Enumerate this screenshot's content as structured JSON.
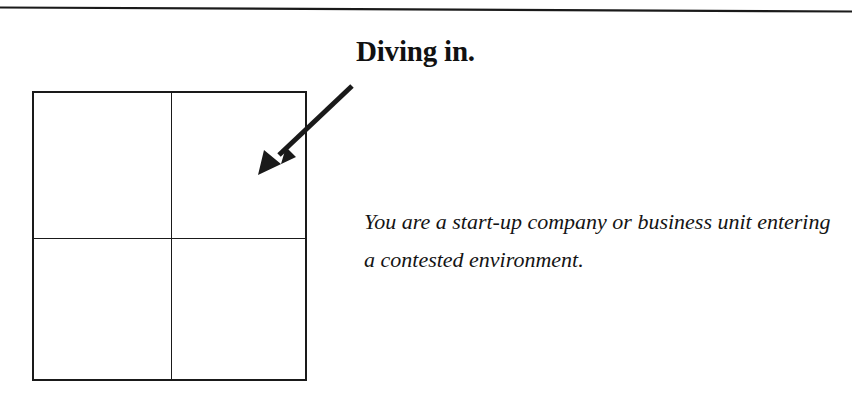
{
  "page": {
    "background_color": "#ffffff",
    "ink_color": "#1a1a1a",
    "width": 852,
    "height": 401
  },
  "divider": {
    "name": "top-horizontal-rule",
    "color": "#1a1a1a"
  },
  "headline": {
    "text": "Diving in."
  },
  "body": {
    "text": "You are a start-up company or business unit entering a contested environment."
  },
  "arrow": {
    "name": "pointer-arrow",
    "color": "#1a1a1a",
    "from_x": 352,
    "from_y": 86,
    "to_x": 259,
    "to_y": 174
  },
  "matrix": {
    "name": "two-by-two-matrix",
    "rows": 2,
    "columns": 2,
    "cells": [
      {
        "label": ""
      },
      {
        "label": ""
      },
      {
        "label": ""
      },
      {
        "label": ""
      }
    ]
  }
}
